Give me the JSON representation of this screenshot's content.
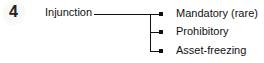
{
  "diagram": {
    "number": "4",
    "root": "Injunction",
    "branches": [
      {
        "label": "Mandatory (rare)"
      },
      {
        "label": "Prohibitory"
      },
      {
        "label": "Asset-freezing"
      }
    ],
    "line_color": "#111111"
  }
}
